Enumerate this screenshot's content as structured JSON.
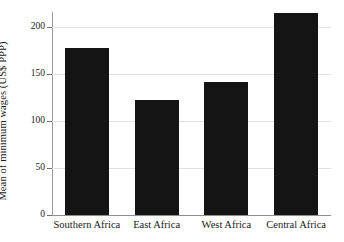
{
  "chart_data": {
    "type": "bar",
    "title": "",
    "xlabel": "",
    "ylabel": "Mean of minimum wages (US$ PPP)",
    "categories": [
      "Southern Africa",
      "East Africa",
      "West Africa",
      "Central Africa"
    ],
    "values": [
      178,
      122,
      141,
      215
    ],
    "ylim": [
      0,
      225
    ],
    "yticks": [
      0,
      50,
      100,
      150,
      200
    ],
    "ytick_labels": [
      "0",
      "50",
      "100",
      "150",
      "200"
    ],
    "grid": "horizontal",
    "legend": "none",
    "bar_color": "#141414",
    "background_color": "#ffffff",
    "axis_color": "#8e8e8e",
    "gridline_color": "#e2e2e2"
  }
}
